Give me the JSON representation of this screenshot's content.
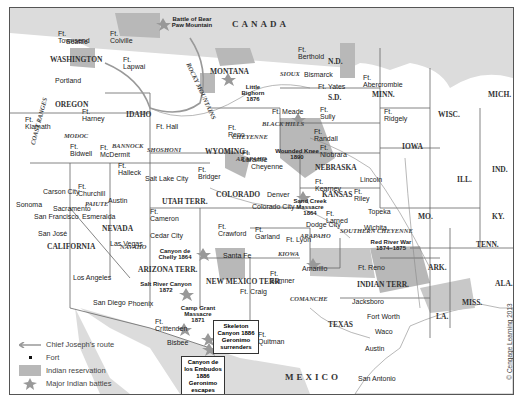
{
  "map": {
    "countries": {
      "north": "CANADA",
      "south": "MEXICO"
    },
    "states": [
      "WASHINGTON",
      "OREGON",
      "IDAHO",
      "MONTANA",
      "WYOMING",
      "N.D.",
      "S.D.",
      "NEBRASKA",
      "COLORADO",
      "KANSAS",
      "NEVADA",
      "CALIFORNIA",
      "UTAH TERR.",
      "ARIZONA TERR.",
      "NEW MEXICO TERR.",
      "TEXAS",
      "INDIAN TERR.",
      "MINN.",
      "IOWA",
      "WISC.",
      "MICH.",
      "ILL.",
      "IND.",
      "MO.",
      "KY.",
      "ARK.",
      "TENN.",
      "LA.",
      "MISS.",
      "ALA."
    ],
    "tribes": [
      "MODOC",
      "BANNOCK",
      "SHOSHONI",
      "SIOUX",
      "CHEYENNE",
      "ARAPAHO",
      "PAIUTE",
      "NAVAHO",
      "KIOWA",
      "COMANCHE",
      "SOUTHERN CHEYENNE",
      "ARAPAHO"
    ],
    "ranges": [
      "COAST RANGES",
      "ROCKY MOUNTAINS",
      "BLACK HILLS"
    ],
    "cities": [
      "Seattle",
      "Portland",
      "Bismarck",
      "Cheyenne",
      "Salt Lake City",
      "Carson City",
      "Sacramento",
      "Sonoma",
      "San Francisco",
      "San José",
      "Austin",
      "Esmeralda",
      "Las Vegas",
      "Cedar City",
      "Denver",
      "Colorado City",
      "Lincoln",
      "Topeka",
      "Dodge City",
      "Wichita",
      "Santa Fe",
      "Amarillo",
      "Los Angeles",
      "San Diego",
      "Phoenix",
      "Bisbee",
      "Jacksboro",
      "Fort Worth",
      "Waco",
      "Austin",
      "San Antonio"
    ],
    "forts": [
      "Ft. Townsend",
      "Ft. Colville",
      "Ft. Lapwai",
      "Ft. Klamath",
      "Ft. Harney",
      "Ft. Hall",
      "Ft. Bidwell",
      "Ft. McDermit",
      "Ft. Halleck",
      "Ft. Churchill",
      "Ft. Berthold",
      "Ft. Yates",
      "Ft. Meade",
      "Ft. Sully",
      "Ft. Randall",
      "Ft. Abercrombie",
      "Ft. Ridgely",
      "Ft. Reno",
      "Ft. Laramie",
      "Ft. Bridger",
      "Ft. Niobrara",
      "Ft. Kearney",
      "Ft. Riley",
      "Ft. Larned",
      "Ft. Cameron",
      "Ft. Crawford",
      "Ft. Garland",
      "Ft. Lyon",
      "Ft. Sumner",
      "Ft. Craig",
      "Ft. Reno",
      "Ft. Crittenden",
      "Ft. Quitman"
    ],
    "battles": {
      "bear_paw": "Battle of Bear Paw Mountain",
      "little_bighorn": "Little Bighorn 1876",
      "wounded_knee": "Wounded Knee 1890",
      "sand_creek": "Sand Creek Massacre 1864",
      "red_river": "Red River War 1874–1875",
      "canyon_de_chelly": "Canyon de Chelly 1864",
      "salt_river": "Salt River Canyon 1872",
      "camp_grant": "Camp Grant Massacre 1871",
      "skeleton_canyon": "Skeleton Canyon 1886 Geronimo surrenders",
      "embudos": "Canyon de los Embudos 1886 Geronimo escapes"
    }
  },
  "legend": {
    "route": "Chief Joseph's route",
    "fort": "Fort",
    "reservation": "Indian reservation",
    "battles": "Major Indian battles"
  },
  "copyright": "© Cengage Learning 2013",
  "colors": {
    "land": "#ffffff",
    "foreign": "#dcdcdc",
    "reservation": "#b8b8b8",
    "border": "#555555"
  }
}
